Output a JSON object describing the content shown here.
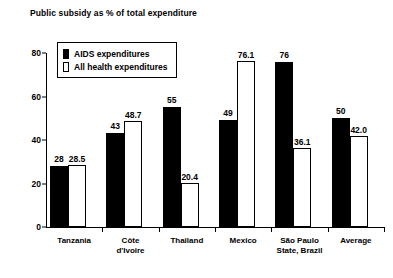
{
  "chart_data": {
    "type": "bar",
    "title": "Public subsidy as % of total expenditure",
    "xlabel": "",
    "ylabel": "",
    "ylim": [
      0,
      80
    ],
    "yticks": [
      0,
      20,
      40,
      60,
      80
    ],
    "grid": false,
    "legend_position": "top-left",
    "categories": [
      "Tanzania",
      "Côte\nd'Ivoire",
      "Thailand",
      "Mexico",
      "São Paulo\nState, Brazil",
      "Average"
    ],
    "series": [
      {
        "name": "AIDS expenditures",
        "color": "#000000",
        "values": [
          28,
          43,
          55,
          49,
          76,
          50
        ],
        "labels": [
          "28",
          "43",
          "55",
          "49",
          "76",
          "50"
        ]
      },
      {
        "name": "All health expenditures",
        "color": "#ffffff",
        "values": [
          28.5,
          48.7,
          20.4,
          76.1,
          36.1,
          42.0
        ],
        "labels": [
          "28.5",
          "48.7",
          "20.4",
          "76.1",
          "36.1",
          "42.0"
        ]
      }
    ]
  }
}
